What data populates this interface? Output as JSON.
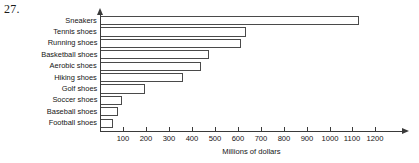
{
  "problem_number": "27.",
  "chart_data": {
    "type": "bar",
    "orientation": "horizontal",
    "title": "",
    "xlabel": "Millions of dollars",
    "ylabel": "",
    "categories": [
      "Sneakers",
      "Tennis shoes",
      "Running shoes",
      "Basketball shoes",
      "Aerobic shoes",
      "Hiking shoes",
      "Golf shoes",
      "Soccer shoes",
      "Baseball shoes",
      "Football shoes"
    ],
    "values": [
      1130,
      635,
      615,
      475,
      440,
      360,
      195,
      95,
      80,
      55
    ],
    "xlim": [
      0,
      1250
    ],
    "xticks": [
      100,
      200,
      300,
      400,
      500,
      600,
      700,
      800,
      900,
      1000,
      1100,
      1200
    ],
    "xtick_labels": [
      "100",
      "200",
      "300",
      "400",
      "500",
      "600",
      "700",
      "800",
      "900",
      "1000",
      "1100",
      "1200"
    ],
    "grid": false,
    "legend": null,
    "bar_fill": "#ffffff",
    "bar_edge": "#4a4a4a",
    "axis_color": "#3a3a3a"
  }
}
